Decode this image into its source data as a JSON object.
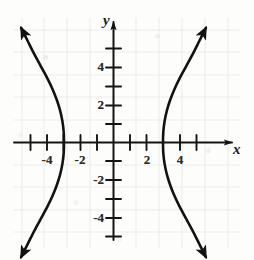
{
  "figure": {
    "kind": "coordinate-graph",
    "background_color": "#fdfdfc",
    "ink_color": "#1a1a1a",
    "grid_color": "#d8d6d2"
  },
  "axes": {
    "x_axis_label": "x",
    "y_axis_label": "y",
    "x_ticks": [
      {
        "value": -5,
        "label": ""
      },
      {
        "value": -4,
        "label": "-4"
      },
      {
        "value": -3,
        "label": ""
      },
      {
        "value": -2,
        "label": "-2"
      },
      {
        "value": -1,
        "label": ""
      },
      {
        "value": 1,
        "label": ""
      },
      {
        "value": 2,
        "label": "2"
      },
      {
        "value": 3,
        "label": ""
      },
      {
        "value": 4,
        "label": "4"
      },
      {
        "value": 5,
        "label": ""
      }
    ],
    "y_ticks": [
      {
        "value": 5,
        "label": ""
      },
      {
        "value": 4,
        "label": "4"
      },
      {
        "value": 3,
        "label": ""
      },
      {
        "value": 2,
        "label": "2"
      },
      {
        "value": 1,
        "label": ""
      },
      {
        "value": -1,
        "label": ""
      },
      {
        "value": -2,
        "label": "-2"
      },
      {
        "value": -3,
        "label": ""
      },
      {
        "value": -4,
        "label": "-4"
      },
      {
        "value": -5,
        "label": ""
      }
    ],
    "x_range": [
      -5.6,
      5.6
    ],
    "y_range": [
      -6.2,
      6.2
    ],
    "grid": "faint"
  },
  "chart_data": {
    "type": "line",
    "title": "",
    "xlabel": "x",
    "ylabel": "y",
    "xlim": [
      -5.6,
      5.6
    ],
    "ylim": [
      -6.2,
      6.2
    ],
    "grid": true,
    "legend": "none",
    "curve_name": "hyperbola opening left and right",
    "equation": "x^2/9 - y^2/25 = 1",
    "vertices": [
      [
        -3,
        0
      ],
      [
        3,
        0
      ]
    ],
    "series": [
      {
        "name": "left-branch",
        "arrowheads": [
          "start",
          "end"
        ],
        "points": [
          [
            -5.6,
            6.1
          ],
          [
            -5.2,
            5.4
          ],
          [
            -4.8,
            4.7
          ],
          [
            -4.4,
            4.05
          ],
          [
            -4.0,
            3.4
          ],
          [
            -3.7,
            2.85
          ],
          [
            -3.45,
            2.3
          ],
          [
            -3.25,
            1.75
          ],
          [
            -3.1,
            1.15
          ],
          [
            -3.02,
            0.58
          ],
          [
            -3.0,
            0.0
          ],
          [
            -3.02,
            -0.58
          ],
          [
            -3.1,
            -1.15
          ],
          [
            -3.25,
            -1.75
          ],
          [
            -3.45,
            -2.3
          ],
          [
            -3.7,
            -2.85
          ],
          [
            -4.0,
            -3.4
          ],
          [
            -4.4,
            -4.05
          ],
          [
            -4.8,
            -4.7
          ],
          [
            -5.2,
            -5.4
          ],
          [
            -5.6,
            -6.1
          ]
        ]
      },
      {
        "name": "right-branch",
        "arrowheads": [
          "start",
          "end"
        ],
        "points": [
          [
            5.6,
            6.1
          ],
          [
            5.2,
            5.4
          ],
          [
            4.8,
            4.7
          ],
          [
            4.4,
            4.05
          ],
          [
            4.0,
            3.4
          ],
          [
            3.7,
            2.85
          ],
          [
            3.45,
            2.3
          ],
          [
            3.25,
            1.75
          ],
          [
            3.1,
            1.15
          ],
          [
            3.02,
            0.58
          ],
          [
            3.0,
            0.0
          ],
          [
            3.02,
            -0.58
          ],
          [
            3.1,
            -1.15
          ],
          [
            3.25,
            -1.75
          ],
          [
            3.45,
            -2.3
          ],
          [
            3.7,
            -2.85
          ],
          [
            4.0,
            -3.4
          ],
          [
            4.4,
            -4.05
          ],
          [
            4.8,
            -4.7
          ],
          [
            5.2,
            -5.4
          ],
          [
            5.6,
            -6.1
          ]
        ]
      }
    ]
  }
}
